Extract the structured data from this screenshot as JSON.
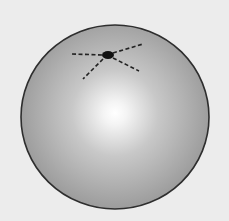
{
  "figure": {
    "background_color": "#ececec",
    "sphere": {
      "cx": 115,
      "cy": 117,
      "rx": 94,
      "ry": 92,
      "fill_edge_color": "#9c9c9c",
      "fill_mid_color": "#c8c8c8",
      "highlight_color": "#ffffff",
      "highlight_cx": 115,
      "highlight_cy": 113,
      "outline_color": "#2e2e2e"
    },
    "point": {
      "cx": 108,
      "cy": 55,
      "rx": 6,
      "ry": 4,
      "color": "#111111"
    },
    "dashed_lines": [
      {
        "name": "left",
        "x1": 72,
        "y1": 54,
        "x2": 103,
        "y2": 55
      },
      {
        "name": "upper-right",
        "x1": 113,
        "y1": 53,
        "x2": 143,
        "y2": 44
      },
      {
        "name": "lower-right",
        "x1": 113,
        "y1": 58,
        "x2": 139,
        "y2": 71
      },
      {
        "name": "lower-left",
        "x1": 103,
        "y1": 59,
        "x2": 83,
        "y2": 79
      }
    ],
    "dash_color": "#222222"
  }
}
